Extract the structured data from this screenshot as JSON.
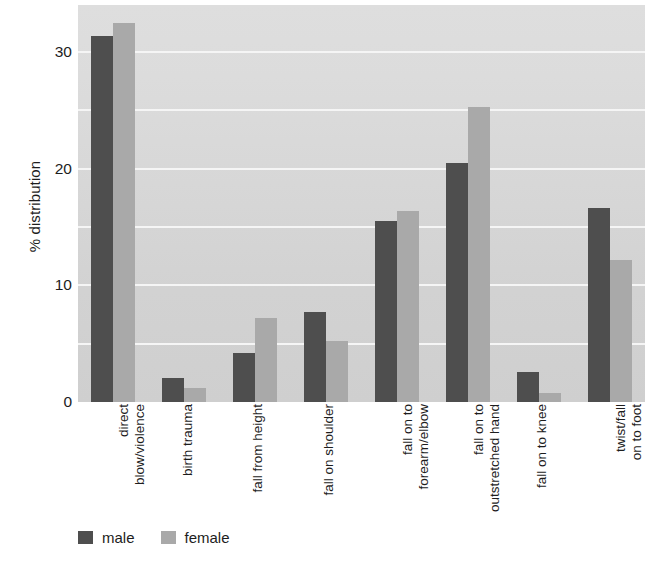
{
  "chart_data": {
    "type": "bar",
    "title": "",
    "subtitle": "",
    "xlabel": "",
    "ylabel": "% distribution",
    "ylim": [
      0,
      34
    ],
    "yticks": [
      0,
      10,
      20,
      30
    ],
    "ytick_labels": [
      "0",
      "10",
      "20",
      "30"
    ],
    "gridlines_at": [
      5,
      10,
      15,
      20,
      25,
      30
    ],
    "grid": true,
    "legend_position": "bottom-left",
    "categories": [
      "direct\nblow/violence",
      "birth trauma",
      "fall from height",
      "fall on shoulder",
      "fall on to\nforearm/elbow",
      "fall on to\noutstretched hand",
      "fall on to knee",
      "twist/fall\non to foot"
    ],
    "series": [
      {
        "name": "male",
        "color": "#4e4e4e",
        "values": [
          31.4,
          2.1,
          4.2,
          7.7,
          15.5,
          20.5,
          2.6,
          16.6
        ]
      },
      {
        "name": "female",
        "color": "#a9a9a9",
        "values": [
          32.5,
          1.2,
          7.2,
          5.2,
          16.4,
          25.3,
          0.8,
          12.2
        ]
      }
    ]
  },
  "legend": {
    "items": [
      {
        "label": "male",
        "color": "#4e4e4e"
      },
      {
        "label": "female",
        "color": "#a9a9a9"
      }
    ]
  },
  "colors": {
    "male": "#4e4e4e",
    "female": "#a9a9a9",
    "plot_background": "#d7d7d7",
    "gridline": "#f5f5f5",
    "text": "#1d1d1d"
  }
}
